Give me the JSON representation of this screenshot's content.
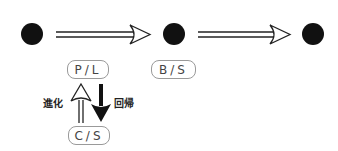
{
  "diagram": {
    "nodes": [
      {
        "id": "node-1"
      },
      {
        "id": "node-2"
      },
      {
        "id": "node-3"
      }
    ],
    "boxes": {
      "pl": "P/L",
      "bs": "B/S",
      "cs": "C/S"
    },
    "labels": {
      "evolution": "進化",
      "regression": "回帰"
    },
    "colors": {
      "dot": "#111111",
      "box_border": "#9a9a9a",
      "text": "#444444"
    }
  }
}
